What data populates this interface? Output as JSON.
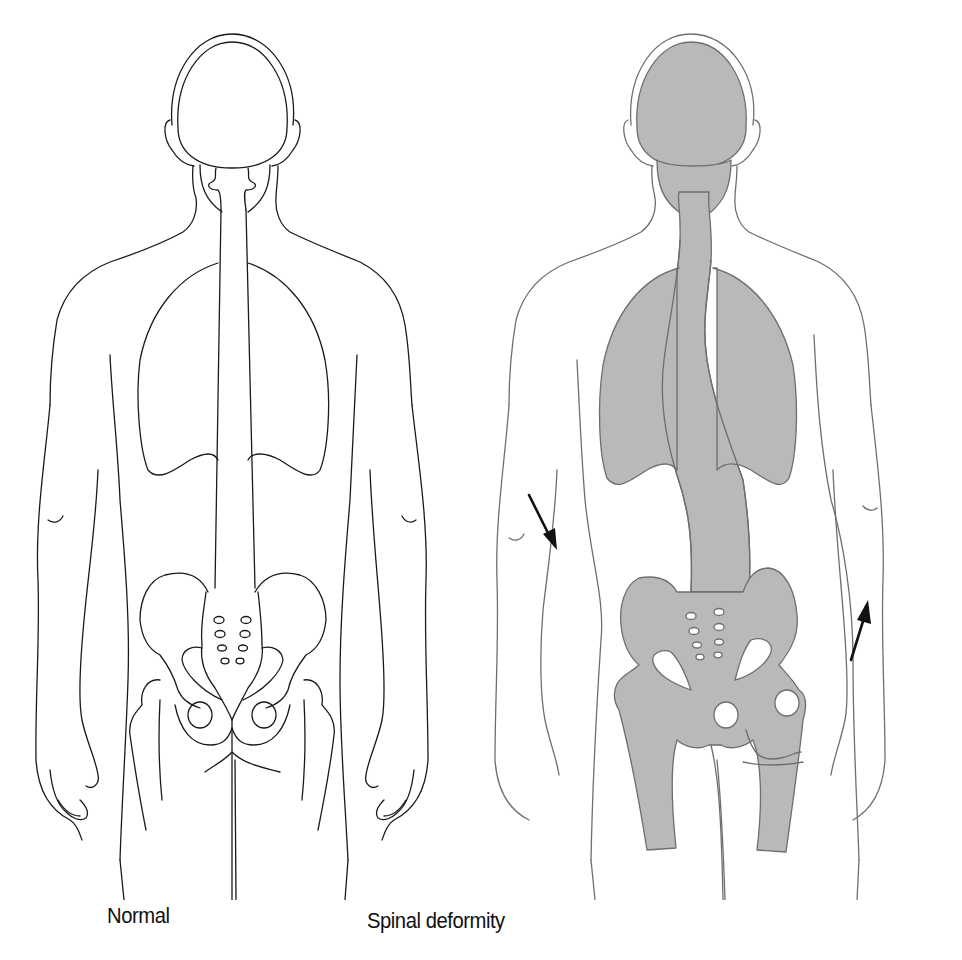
{
  "figure": {
    "type": "anatomical-comparison",
    "panels": [
      {
        "id": "normal",
        "caption": "Normal",
        "line_color": "#1a1a1a",
        "fill_color": "#ffffff",
        "spine": "straight",
        "arrows": []
      },
      {
        "id": "spinal-deformity",
        "caption": "Spinal deformity",
        "line_color": "#6e6e6e",
        "fill_color": "#b9b9b9",
        "spine": "s-curved",
        "arrows": [
          {
            "direction": "down-right",
            "meaning": "shoulder/trunk lowered on concave side"
          },
          {
            "direction": "up-right",
            "meaning": "hip raised on opposite side"
          }
        ]
      }
    ]
  }
}
